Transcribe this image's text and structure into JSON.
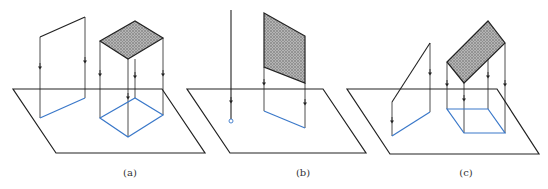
{
  "figure": {
    "panels": [
      {
        "id": "a",
        "caption": "(a)",
        "content": "projection of a line and a horizontal shaded plane onto a ground plane"
      },
      {
        "id": "b",
        "caption": "(b)",
        "content": "projection of a vertical line (collapses to point) and vertical shaded plane (collapses to line)"
      },
      {
        "id": "c",
        "caption": "(c)",
        "content": "projection of an inclined line and an inclined shaded plane"
      }
    ],
    "colors": {
      "outline": "#222222",
      "projection": "#3a78c9",
      "shade": "#9a9a9a"
    }
  }
}
